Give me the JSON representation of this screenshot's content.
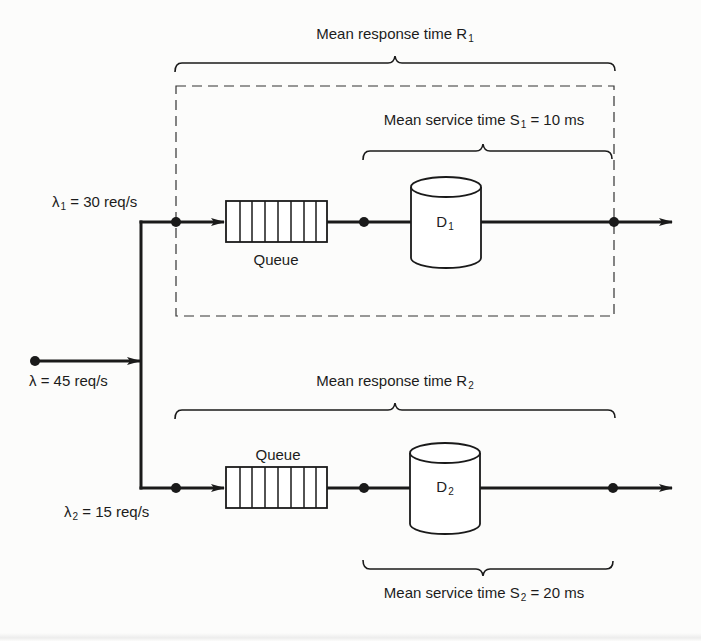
{
  "diagram": {
    "type": "queueing-network",
    "colors": {
      "ink": "#1a1a1a",
      "background": "#fcfcfb",
      "dashed_box": "#333333"
    },
    "input": {
      "label": "λ = 45 req/s",
      "symbol": "λ",
      "rate_text": " = 45 req/s"
    },
    "branch_1": {
      "arrival_symbol": "λ",
      "arrival_sub": "1",
      "arrival_rate_text": " = 30 req/s",
      "queue_label": "Queue",
      "device_name": "D",
      "device_sub": "1",
      "response_label": "Mean response time R",
      "response_sub": "1",
      "service_label": "Mean service time S",
      "service_sub": "1",
      "service_value": " = 10 ms"
    },
    "branch_2": {
      "arrival_symbol": "λ",
      "arrival_sub": "2",
      "arrival_rate_text": " = 15 req/s",
      "queue_label": "Queue",
      "device_name": "D",
      "device_sub": "2",
      "response_label": "Mean response time R",
      "response_sub": "2",
      "service_label": "Mean service time S",
      "service_sub": "2",
      "service_value": " = 20 ms"
    },
    "nodes": [
      {
        "id": "source",
        "x": 35,
        "y": 361
      },
      {
        "id": "split-1",
        "x": 176,
        "y": 222
      },
      {
        "id": "device-in-1",
        "x": 364,
        "y": 222
      },
      {
        "id": "exit-1",
        "x": 614,
        "y": 222
      },
      {
        "id": "split-2",
        "x": 176,
        "y": 488
      },
      {
        "id": "device-in-2",
        "x": 364,
        "y": 488
      },
      {
        "id": "exit-2",
        "x": 614,
        "y": 488
      }
    ]
  }
}
